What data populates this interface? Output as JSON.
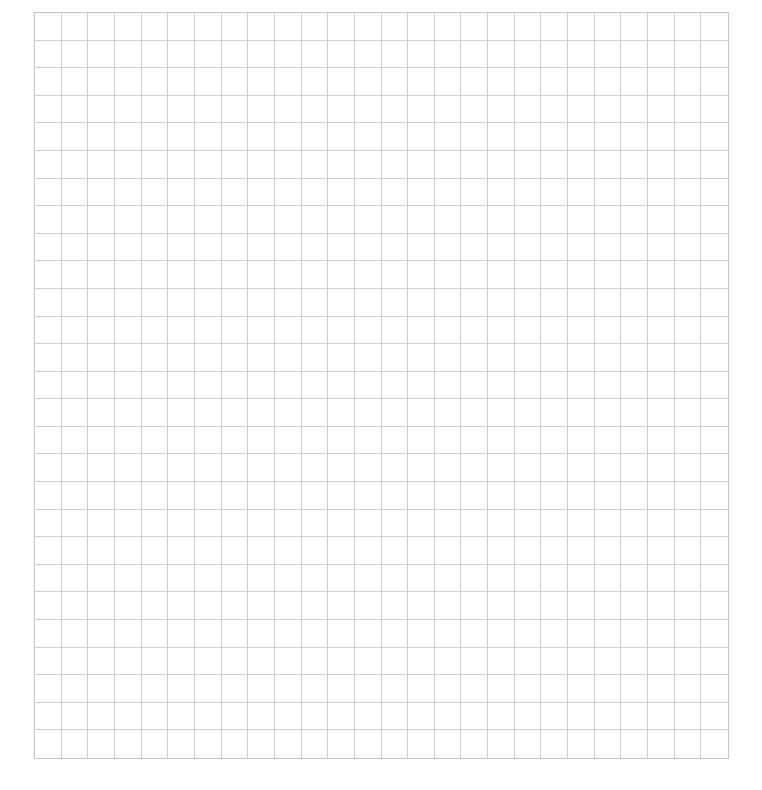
{
  "page": {
    "background_color": "#ffffff"
  },
  "grid": {
    "columns": 26,
    "rows": 27,
    "line_color": "#cdcdcd",
    "border_color": "#c4c4c4",
    "left": 34,
    "top": 12,
    "width": 695,
    "height": 747
  }
}
